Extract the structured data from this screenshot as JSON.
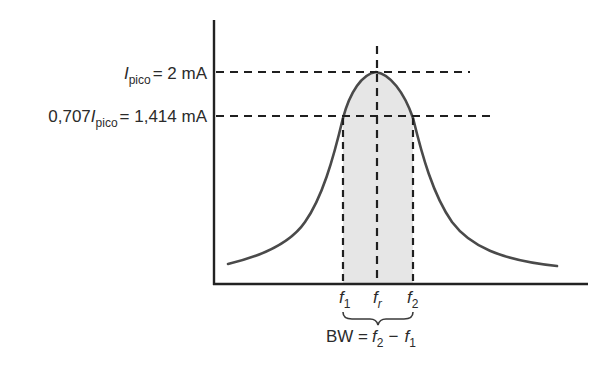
{
  "diagram": {
    "type": "resonance-curve",
    "colors": {
      "curve": "#4a4a4a",
      "axis": "#222222",
      "dashed": "#1f1f1f",
      "shade": "#e6e6e6",
      "text": "#2b2b2b"
    },
    "labels": {
      "peak": {
        "symbol": "I",
        "subscript": "pico",
        "rest": "= 2 mA"
      },
      "half_power": {
        "prefix": "0,707",
        "symbol": "I",
        "subscript": "pico",
        "rest": "= 1,414 mA"
      },
      "f1": {
        "symbol": "f",
        "subscript": "1"
      },
      "fr": {
        "symbol": "f",
        "subscript": "r"
      },
      "f2": {
        "symbol": "f",
        "subscript": "2"
      },
      "bandwidth": {
        "prefix": "BW =",
        "a_symbol": "f",
        "a_subscript": "2",
        "minus": "−",
        "b_symbol": "f",
        "b_subscript": "1"
      }
    }
  }
}
